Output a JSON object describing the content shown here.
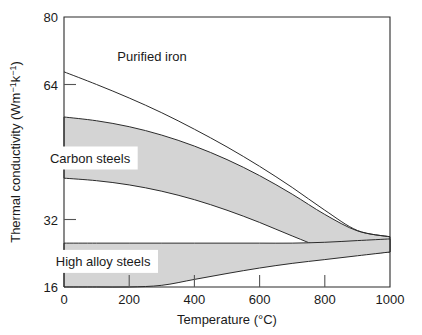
{
  "chart_data": {
    "type": "area",
    "title": "",
    "xlabel": "Temperature (°C)",
    "ylabel": "Thermal conductivity (Wm−1k−1)",
    "ylabel_parts": {
      "main": "Thermal conductivity (Wm",
      "sup1": "−1",
      "mid": "k",
      "sup2": "−1",
      "close": ")"
    },
    "xlim": [
      0,
      1000
    ],
    "ylim": [
      16,
      80
    ],
    "xticks": [
      0,
      200,
      400,
      600,
      800,
      1000
    ],
    "xticklabels": [
      "0",
      "200",
      "400",
      "600",
      "800",
      "1000"
    ],
    "yticks": [
      16,
      32,
      48,
      64,
      80
    ],
    "yticklabels": [
      "16",
      "32",
      "48",
      "64",
      "80"
    ],
    "grid": false,
    "legend_position": "inline-annotations",
    "x": [
      0,
      100,
      200,
      300,
      400,
      500,
      600,
      700,
      800,
      900,
      1000
    ],
    "series": [
      {
        "name": "Purified iron",
        "kind": "line",
        "values": [
          67.0,
          64.0,
          60.8,
          57.3,
          53.4,
          49.2,
          44.6,
          39.6,
          34.2,
          29.4,
          27.9
        ]
      },
      {
        "name": "Carbon steels",
        "kind": "band",
        "upper": [
          56.3,
          55.4,
          54.0,
          52.0,
          49.4,
          46.2,
          42.4,
          38.0,
          33.2,
          29.3,
          27.9
        ],
        "lower": [
          41.8,
          41.2,
          40.2,
          38.7,
          36.7,
          34.2,
          31.3,
          28.1,
          25.2,
          23.9,
          24.3
        ]
      },
      {
        "name": "High alloy steels",
        "kind": "band",
        "upper": [
          26.4,
          26.4,
          26.4,
          26.4,
          26.4,
          26.4,
          26.4,
          26.4,
          26.6,
          27.0,
          27.4
        ],
        "lower": [
          16.0,
          16.0,
          16.0,
          16.4,
          17.8,
          19.2,
          20.5,
          21.6,
          22.5,
          23.4,
          24.3
        ]
      }
    ],
    "annotations": [
      {
        "text": "Purified iron",
        "x": 270,
        "y": 69.5
      },
      {
        "text": "Carbon steels",
        "x": 80,
        "y": 45.5
      },
      {
        "text": "High alloy steels",
        "x": 120,
        "y": 21.0
      }
    ],
    "colors": {
      "band_fill": "#d4d4d4",
      "line": "#2b2b2b",
      "axis": "#2b2b2b",
      "background": "#ffffff",
      "text": "#1a1a1a"
    }
  }
}
